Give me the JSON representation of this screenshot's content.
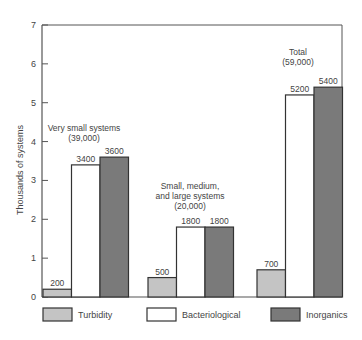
{
  "chart_data": {
    "type": "bar",
    "title": "",
    "xlabel": "",
    "ylabel": "Thousands of systems",
    "ylim": [
      0,
      7
    ],
    "yticks": [
      0,
      1,
      2,
      3,
      4,
      5,
      6,
      7
    ],
    "grid": false,
    "legend_position": "bottom",
    "categories": [
      "Very small systems (39,000)",
      "Small, medium, and large systems (20,000)",
      "Total (59,000)"
    ],
    "category_annotations": [
      {
        "lines": [
          "Very small systems",
          "(39,000)"
        ]
      },
      {
        "lines": [
          "Small, medium,",
          "and large systems",
          "(20,000)"
        ]
      },
      {
        "lines": [
          "Total",
          "(59,000)"
        ]
      }
    ],
    "series": [
      {
        "name": "Turbidity",
        "color": "#c4c4c4",
        "values": [
          200,
          500,
          700
        ]
      },
      {
        "name": "Bacteriological",
        "color": "#ffffff",
        "values": [
          3400,
          1800,
          5200
        ]
      },
      {
        "name": "Inorganics",
        "color": "#7a7a7a",
        "values": [
          3600,
          1800,
          5400
        ]
      }
    ],
    "value_labels": [
      [
        "200",
        "500",
        "700"
      ],
      [
        "3400",
        "1800",
        "5200"
      ],
      [
        "3600",
        "1800",
        "5400"
      ]
    ]
  },
  "legend": {
    "items": [
      {
        "label": "Turbidity",
        "color": "#c4c4c4"
      },
      {
        "label": "Bacteriological",
        "color": "#ffffff"
      },
      {
        "label": "Inorganics",
        "color": "#7a7a7a"
      }
    ]
  },
  "axis": {
    "y_label": "Thousands of systems",
    "ticks": [
      "0",
      "1",
      "2",
      "3",
      "4",
      "5",
      "6",
      "7"
    ]
  }
}
